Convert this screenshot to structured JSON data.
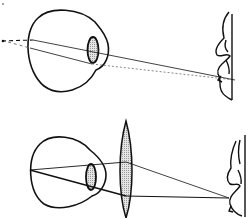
{
  "diagram": {
    "type": "optics-illustration",
    "panels": [
      {
        "id": "uncorrected",
        "elements": [
          "eyeball",
          "crystalline-lens",
          "light-rays",
          "virtual-focus-dashed-extension",
          "object-figure"
        ]
      },
      {
        "id": "corrected",
        "elements": [
          "eyeball",
          "crystalline-lens",
          "convex-corrective-lens",
          "light-rays",
          "object-figure"
        ]
      }
    ],
    "colors": {
      "stroke": "#111111",
      "lens_fill": "#c8c8c8",
      "background": "#ffffff"
    }
  }
}
